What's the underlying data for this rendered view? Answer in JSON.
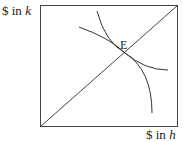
{
  "diagram": {
    "y_axis_label": "$ in k",
    "y_axis_prefix": "$ in ",
    "y_axis_var": "k",
    "x_axis_label": "$ in h",
    "x_axis_prefix": "$ in ",
    "x_axis_var": "h",
    "point_label": "E",
    "elements": [
      "box",
      "diagonal line",
      "steep convex curve",
      "flatter curve",
      "intersection point E"
    ],
    "line_color": "#333333"
  }
}
